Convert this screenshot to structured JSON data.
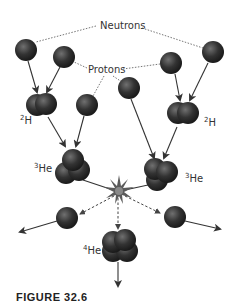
{
  "labels": {
    "neutrons": "Neutrons",
    "protons": "Protons",
    "h2_left_mass": "2",
    "h2_left_sym": "H",
    "h2_right_mass": "2",
    "h2_right_sym": "H",
    "he3_left_mass": "3",
    "he3_left_sym": "He",
    "he3_right_mass": "3",
    "he3_right_sym": "He",
    "he4_mass": "4",
    "he4_sym": "He"
  },
  "caption": "FIGURE 32.6",
  "colors": {
    "particle": "#2e2e2e",
    "particle_highlight": "#6a6a6a",
    "arrow": "#333333",
    "dotted_line": "#555555",
    "starburst": "#555555"
  }
}
